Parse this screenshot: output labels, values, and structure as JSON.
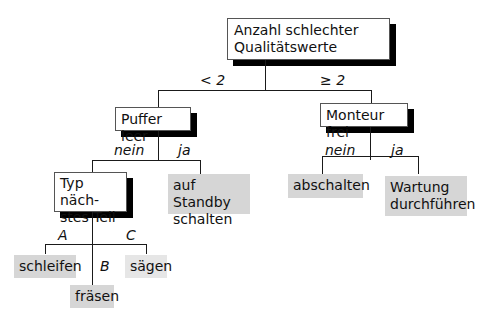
{
  "root": {
    "line1": "Anzahl schlechter",
    "line2": "Qualitätswerte"
  },
  "root_branches": {
    "left": "< 2",
    "right": "≥ 2"
  },
  "left_node": {
    "label": "Puffer leer",
    "branches": {
      "left": "nein",
      "right": "ja"
    },
    "right_leaf": {
      "line1": "auf Standby",
      "line2": "schalten"
    },
    "child_node": {
      "line1": "Typ näch-",
      "line2": "stes Teil",
      "branches": {
        "a": "A",
        "b": "B",
        "c": "C"
      },
      "leaves": {
        "a": "schleifen",
        "b": "fräsen",
        "c": "sägen"
      }
    }
  },
  "right_node": {
    "label": "Monteur frei",
    "branches": {
      "left": "nein",
      "right": "ja"
    },
    "leaves": {
      "left": "abschalten",
      "right_line1": "Wartung",
      "right_line2": "durchführen"
    }
  }
}
